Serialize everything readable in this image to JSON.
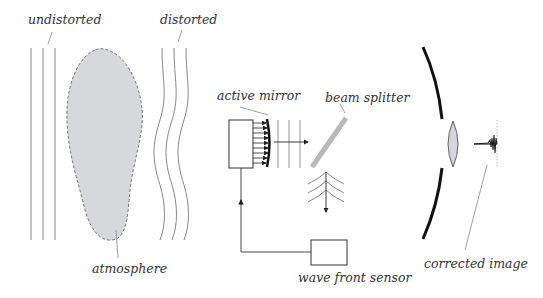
{
  "diagram": {
    "labels": {
      "undistorted": "undistorted",
      "distorted": "distorted",
      "atmosphere": "atmosphere",
      "active_mirror": "active mirror",
      "beam_splitter": "beam splitter",
      "wavefront_sensor": "wave front sensor",
      "corrected_image": "corrected image"
    },
    "colors": {
      "line": "#888888",
      "dark_line": "#222222",
      "atmosphere_fill": "#d6d8dc",
      "atmosphere_border": "#777777",
      "beam_splitter": "#b8b9bd",
      "lens_fill": "#d5d6dc",
      "background": "#ffffff"
    },
    "components": [
      "undistorted-wavefronts",
      "atmosphere",
      "distorted-wavefronts",
      "active-mirror",
      "actuator-box",
      "beam-splitter",
      "wavefront-sensor",
      "feedback-loop",
      "telescope-mirror",
      "lens",
      "corrected-image-profile"
    ]
  }
}
